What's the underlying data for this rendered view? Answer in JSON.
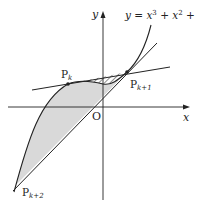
{
  "diagram": {
    "axes": {
      "x_label": "x",
      "y_label": "y",
      "origin_label": "O"
    },
    "curve": {
      "equation_prefix": "y = x",
      "exp1": "3",
      "mid": " + x",
      "exp2": "2",
      "suffix": " + 1"
    },
    "points": [
      {
        "name": "P",
        "sub": "k"
      },
      {
        "name": "P",
        "sub": "k+1"
      },
      {
        "name": "P",
        "sub": "k+2"
      }
    ],
    "regions": {
      "hatched": "region between curve and tangent line near P_k to P_k+1",
      "shaded": "region between curve and tangent line from P_k+1 to P_k+2"
    },
    "colors": {
      "stroke": "#222222",
      "shade": "#d9d9d9"
    }
  }
}
